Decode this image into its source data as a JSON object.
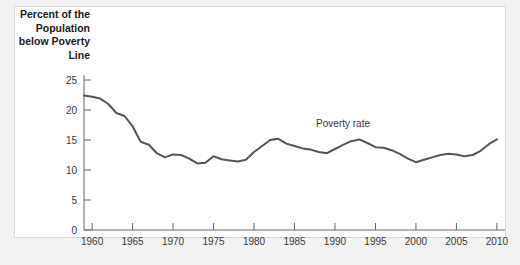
{
  "figure": {
    "background_color": "#f2f2f2",
    "panel_color": "#ffffff",
    "line_color": "#555555",
    "axis_color": "#666666",
    "text_color": "#3a3a3a"
  },
  "axis_label": {
    "text": "Percent of the\nPopulation\nbelow Poverty\nLine"
  },
  "annotation": {
    "poverty_rate_label": "Poverty rate"
  },
  "chart_data": {
    "type": "line",
    "title": "",
    "subtitle": "",
    "xlabel": "",
    "ylabel": "Percent of the Population below Poverty Line",
    "xlim": [
      1959,
      2011
    ],
    "ylim": [
      0,
      27
    ],
    "grid": false,
    "legend": "none",
    "annotations": [
      {
        "text": "Poverty rate",
        "x": 1991,
        "y": 17.2
      }
    ],
    "xticks": [
      1960,
      1965,
      1970,
      1975,
      1980,
      1985,
      1990,
      1995,
      2000,
      2005,
      2010
    ],
    "xtick_labels": [
      "1960",
      "1965",
      "1970",
      "1975",
      "1980",
      "1985",
      "1990",
      "1995",
      "2000",
      "2005",
      "2010"
    ],
    "yticks": [
      0,
      5,
      10,
      15,
      20,
      25
    ],
    "ytick_labels": [
      "0",
      "5",
      "10",
      "15",
      "20",
      "25"
    ],
    "series": [
      {
        "name": "Poverty rate",
        "color": "#555555",
        "x": [
          1959,
          1960,
          1961,
          1962,
          1963,
          1964,
          1965,
          1966,
          1967,
          1968,
          1969,
          1970,
          1971,
          1972,
          1973,
          1974,
          1975,
          1976,
          1977,
          1978,
          1979,
          1980,
          1981,
          1982,
          1983,
          1984,
          1985,
          1986,
          1987,
          1988,
          1989,
          1990,
          1991,
          1992,
          1993,
          1994,
          1995,
          1996,
          1997,
          1998,
          1999,
          2000,
          2001,
          2002,
          2003,
          2004,
          2005,
          2006,
          2007,
          2008,
          2009,
          2010
        ],
        "values": [
          22.4,
          22.2,
          21.9,
          21.0,
          19.5,
          19.0,
          17.3,
          14.7,
          14.2,
          12.8,
          12.1,
          12.6,
          12.5,
          11.9,
          11.1,
          11.2,
          12.3,
          11.8,
          11.6,
          11.4,
          11.7,
          13.0,
          14.0,
          15.0,
          15.2,
          14.4,
          14.0,
          13.6,
          13.4,
          13.0,
          12.8,
          13.5,
          14.2,
          14.8,
          15.1,
          14.5,
          13.8,
          13.7,
          13.3,
          12.7,
          11.9,
          11.3,
          11.7,
          12.1,
          12.5,
          12.7,
          12.6,
          12.3,
          12.5,
          13.2,
          14.3,
          15.1
        ]
      }
    ]
  }
}
